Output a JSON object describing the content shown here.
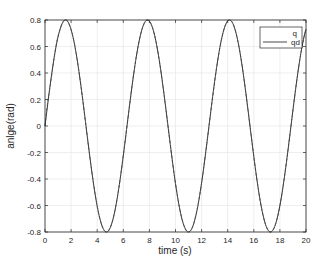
{
  "chart_data": {
    "type": "line",
    "title": "",
    "xlabel": "time (s)",
    "ylabel": "angle(rad)",
    "ylabel_display": "anlge(rad)",
    "xlim": [
      0,
      20
    ],
    "ylim": [
      -0.8,
      0.8
    ],
    "grid": true,
    "legend_position": "upper right",
    "x_ticks": [
      "0",
      "2",
      "4",
      "6",
      "8",
      "10",
      "12",
      "14",
      "16",
      "18",
      "20"
    ],
    "y_ticks": [
      "-0.8",
      "-0.6",
      "-0.4",
      "-0.2",
      "0",
      "0.2",
      "0.4",
      "0.6",
      "0.8"
    ],
    "series": [
      {
        "name": "q",
        "style": "dashed",
        "color": "#4d4d4d",
        "function": "0.8*sin(t)",
        "x": [
          0,
          1.57,
          4.71,
          7.85,
          11.0,
          14.14,
          17.28,
          20
        ],
        "values": [
          0,
          0.8,
          -0.8,
          0.8,
          -0.8,
          0.8,
          -0.8,
          0.73
        ]
      },
      {
        "name": "qd",
        "style": "solid",
        "color": "#333333",
        "function": "0.8*sin(t)",
        "x": [
          0,
          1.57,
          4.71,
          7.85,
          11.0,
          14.14,
          17.28,
          20
        ],
        "values": [
          0,
          0.8,
          -0.8,
          0.8,
          -0.8,
          0.8,
          -0.8,
          0.73
        ]
      }
    ]
  },
  "legend": {
    "items": [
      {
        "label": "q"
      },
      {
        "label": "qd"
      }
    ]
  },
  "axes": {
    "xlabel": "time (s)",
    "ylabel": "anlge(rad)"
  },
  "colors": {
    "axis": "#262626",
    "grid": "#e6e6e6",
    "line": "#333333"
  }
}
